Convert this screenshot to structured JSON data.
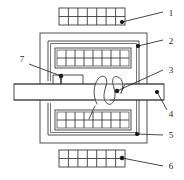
{
  "diagram": {
    "type": "line-drawing",
    "canvas": {
      "width": 184,
      "height": 180
    },
    "colors": {
      "stroke": "#3d3d3d",
      "stroke_dark": "#1a1a1a",
      "fill": "#ffffff",
      "background": "#ffffff",
      "marker": "#111111"
    },
    "callouts": [
      {
        "id": "1",
        "label": "1",
        "text_x": 171,
        "text_y": 16,
        "dot_x": 122,
        "dot_y": 22,
        "line_to_x": 163,
        "line_to_y": 12,
        "target": "upper-outer-winding-bar"
      },
      {
        "id": "2",
        "label": "2",
        "text_x": 171,
        "text_y": 44,
        "dot_x": 138,
        "dot_y": 46,
        "line_to_x": 163,
        "line_to_y": 40,
        "target": "outer-core-frame"
      },
      {
        "id": "3",
        "label": "3",
        "text_x": 171,
        "text_y": 73,
        "dot_x": 117,
        "dot_y": 91,
        "line_to_x": 163,
        "line_to_y": 70,
        "target": "coil-winding"
      },
      {
        "id": "4",
        "label": "4",
        "text_x": 171,
        "text_y": 117,
        "dot_x": 157,
        "dot_y": 92,
        "line_to_x": 167,
        "line_to_y": 110,
        "target": "movable-armature-bar"
      },
      {
        "id": "5",
        "label": "5",
        "text_x": 171,
        "text_y": 138,
        "dot_x": 137,
        "dot_y": 134,
        "line_to_x": 163,
        "line_to_y": 135,
        "target": "lower-inner-winding-block"
      },
      {
        "id": "6",
        "label": "6",
        "text_x": 171,
        "text_y": 169,
        "dot_x": 122,
        "dot_y": 158,
        "line_to_x": 163,
        "line_to_y": 166,
        "target": "lower-outer-winding-bar"
      },
      {
        "id": "7",
        "label": "7",
        "text_x": 22,
        "text_y": 62,
        "dot_x": 61,
        "dot_y": 76,
        "line_to_x": 29,
        "line_to_y": 64,
        "target": "contact-block"
      }
    ],
    "parts": {
      "upper_outer_bar": {
        "name": "upper-outer-winding-bar",
        "x": 59,
        "y": 8,
        "width": 66,
        "height": 17,
        "segments": 7,
        "mid_rule": true
      },
      "lower_outer_bar": {
        "name": "lower-outer-winding-bar",
        "x": 59,
        "y": 150,
        "width": 66,
        "height": 17,
        "segments": 7,
        "mid_rule": true
      },
      "outer_core_frame": {
        "name": "outer-core-frame",
        "x": 40,
        "y": 33,
        "width": 107,
        "height": 110
      },
      "inner_core_frame": {
        "name": "inner-core-frame",
        "x": 48,
        "y": 41,
        "width": 91,
        "height": 94
      },
      "upper_inner_block": {
        "name": "upper-inner-winding-block",
        "x": 55,
        "y": 48,
        "width": 76,
        "height": 20,
        "segments": 8,
        "mid_rule": true
      },
      "lower_inner_block": {
        "name": "lower-inner-winding-block",
        "x": 55,
        "y": 110,
        "width": 76,
        "height": 20,
        "segments": 8,
        "mid_rule": true
      },
      "armature_bar": {
        "name": "movable-armature-bar",
        "x": 14,
        "y": 84,
        "width": 150,
        "height": 16
      },
      "contact_block": {
        "name": "contact-block",
        "x": 53,
        "y": 75,
        "width": 30,
        "height": 10
      },
      "coil": {
        "name": "coil-winding",
        "loops": 3,
        "center_x": 108,
        "top_y": 78,
        "bottom_y": 104,
        "lead_x": 95,
        "lead_y": 106
      }
    }
  }
}
